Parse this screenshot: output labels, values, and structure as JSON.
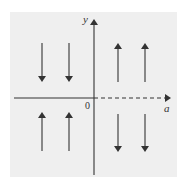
{
  "diagram": {
    "type": "sign-diagram",
    "axes": {
      "x_label": "a",
      "y_label": "y",
      "origin_label": "0",
      "positive_x_axis_style": "dashed",
      "negative_x_axis_style": "solid"
    },
    "arrows": [
      {
        "quadrant": "upper-left",
        "direction": "down"
      },
      {
        "quadrant": "upper-left",
        "direction": "down"
      },
      {
        "quadrant": "upper-right",
        "direction": "up"
      },
      {
        "quadrant": "upper-right",
        "direction": "up"
      },
      {
        "quadrant": "lower-left",
        "direction": "up"
      },
      {
        "quadrant": "lower-left",
        "direction": "up"
      },
      {
        "quadrant": "lower-right",
        "direction": "down"
      },
      {
        "quadrant": "lower-right",
        "direction": "down"
      }
    ],
    "colors": {
      "background": "#efefef",
      "ink": "#333333"
    }
  }
}
